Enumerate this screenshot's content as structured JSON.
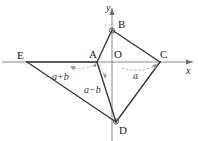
{
  "figure": {
    "kind": "geometry-diagram",
    "canvas": {
      "width": 198,
      "height": 141
    },
    "colors": {
      "background": "#ffffff",
      "stroke": "#3a3a3a",
      "axis": "#8a8a8a",
      "dashed": "#9a9a9a",
      "text": "#222222"
    },
    "axes": {
      "origin": {
        "x": 112,
        "y": 62
      },
      "x_axis": {
        "label": "x",
        "label_x": 186,
        "label_y": 66,
        "from_x": 2,
        "to_x": 195,
        "y": 62
      },
      "y_axis": {
        "label": "y",
        "label_x": 106,
        "label_y": 3,
        "x": 112,
        "from_y": 6,
        "to_y": 141
      }
    },
    "points": [
      {
        "id": "E",
        "label": "E",
        "x": 27,
        "y": 62,
        "label_x": 17,
        "label_y": 50
      },
      {
        "id": "A",
        "label": "A",
        "x": 97,
        "y": 62,
        "label_x": 89,
        "label_y": 49
      },
      {
        "id": "O",
        "label": "O",
        "x": 112,
        "y": 62,
        "label_x": 114,
        "label_y": 49
      },
      {
        "id": "B",
        "label": "B",
        "x": 112,
        "y": 30,
        "label_x": 118,
        "label_y": 19
      },
      {
        "id": "C",
        "label": "C",
        "x": 160,
        "y": 62,
        "label_x": 160,
        "label_y": 49
      },
      {
        "id": "D",
        "label": "D",
        "x": 116,
        "y": 122,
        "label_x": 119,
        "label_y": 125
      }
    ],
    "segments": [
      {
        "from": "A",
        "to": "B",
        "name": "segment-ab"
      },
      {
        "from": "B",
        "to": "C",
        "name": "segment-bc"
      },
      {
        "from": "C",
        "to": "D",
        "name": "segment-cd"
      },
      {
        "from": "D",
        "to": "A",
        "name": "segment-da"
      },
      {
        "from": "E",
        "to": "D",
        "name": "segment-ed"
      },
      {
        "from": "E",
        "to": "A",
        "name": "segment-ea"
      }
    ],
    "right_angle_markers": [
      {
        "at": "B",
        "name": "right-angle-marker-b"
      },
      {
        "at": "D",
        "name": "right-angle-marker-d"
      }
    ],
    "angle_labels": [
      {
        "id": "a-plus-b",
        "text": "a+b",
        "x": 52,
        "y": 72,
        "name": "angle-label-a-plus-b"
      },
      {
        "id": "a-minus-b",
        "text": "a−b",
        "x": 84,
        "y": 85,
        "name": "angle-label-a-minus-b"
      },
      {
        "id": "a",
        "text": "a",
        "x": 133,
        "y": 71,
        "name": "angle-label-a"
      }
    ],
    "angle_arcs": [
      {
        "id": "arc-a-plus-b",
        "name": "angle-arc-a-plus-b"
      },
      {
        "id": "arc-a-minus-b",
        "name": "angle-arc-a-minus-b"
      },
      {
        "id": "arc-a",
        "name": "angle-arc-a"
      }
    ]
  }
}
